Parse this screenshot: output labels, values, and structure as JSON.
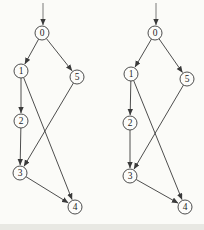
{
  "figure": {
    "colors": {
      "background": "#fbfbf8",
      "stroke": "#3a3a3a",
      "entry_stroke": "#6b6b6b",
      "node_fill": "#fcfcfa",
      "label_text": "#1e1e1e",
      "bottom_edge_artifact": "#e8e8e3"
    },
    "node_radius": 7,
    "graphs": [
      {
        "id": "left-graph",
        "entry_edge": {
          "x": 43,
          "y_start": 3,
          "target": "0"
        },
        "nodes": [
          {
            "id": "0",
            "x": 42,
            "y": 33
          },
          {
            "id": "1",
            "x": 21,
            "y": 71
          },
          {
            "id": "5",
            "x": 77,
            "y": 77
          },
          {
            "id": "2",
            "x": 21,
            "y": 121
          },
          {
            "id": "3",
            "x": 20,
            "y": 173
          },
          {
            "id": "4",
            "x": 75,
            "y": 207
          }
        ],
        "edges": [
          {
            "from": "0",
            "to": "1"
          },
          {
            "from": "0",
            "to": "5"
          },
          {
            "from": "1",
            "to": "2"
          },
          {
            "from": "1",
            "to": "4"
          },
          {
            "from": "2",
            "to": "3"
          },
          {
            "from": "5",
            "to": "3"
          },
          {
            "from": "3",
            "to": "4"
          }
        ]
      },
      {
        "id": "right-graph",
        "entry_edge": {
          "x": 156,
          "y_start": 3,
          "target": "0"
        },
        "nodes": [
          {
            "id": "0",
            "x": 155,
            "y": 33
          },
          {
            "id": "1",
            "x": 131,
            "y": 74
          },
          {
            "id": "5",
            "x": 187,
            "y": 79
          },
          {
            "id": "2",
            "x": 130,
            "y": 123
          },
          {
            "id": "3",
            "x": 130,
            "y": 176
          },
          {
            "id": "4",
            "x": 185,
            "y": 207
          }
        ],
        "edges": [
          {
            "from": "0",
            "to": "1"
          },
          {
            "from": "0",
            "to": "5"
          },
          {
            "from": "1",
            "to": "2"
          },
          {
            "from": "1",
            "to": "4"
          },
          {
            "from": "2",
            "to": "3"
          },
          {
            "from": "5",
            "to": "3"
          },
          {
            "from": "3",
            "to": "4"
          }
        ]
      }
    ]
  }
}
